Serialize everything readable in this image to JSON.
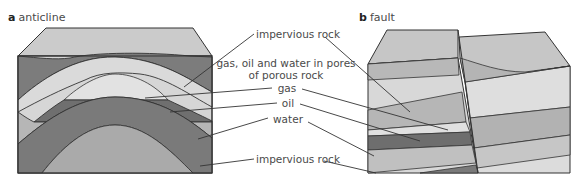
{
  "figures": [
    {
      "letter": "a",
      "title": "anticline"
    },
    {
      "letter": "b",
      "title": "fault"
    }
  ],
  "labels": {
    "impervious_top": "impervious rock",
    "porous_line1": "gas, oil and water in pores",
    "porous_line2": "of porous rock",
    "gas": "gas",
    "oil": "oil",
    "water": "water",
    "impervious_bottom": "impervious rock"
  },
  "colors": {
    "top_surface": "#c8c8c8",
    "impervious": "#7a7a7a",
    "porous": "#d9d9d9",
    "gas": "#dedede",
    "oil": "#6e6e6e",
    "water": "#b4b4b4",
    "core": "#a9a9a9"
  }
}
